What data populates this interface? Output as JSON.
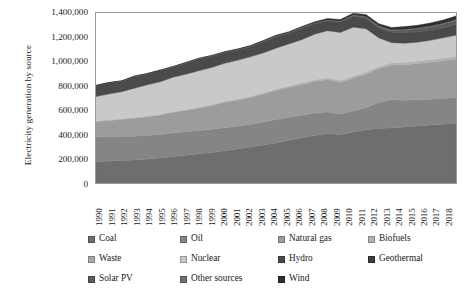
{
  "chart_data": {
    "type": "area",
    "title": "",
    "xlabel": "",
    "ylabel": "Electricity generation by source",
    "stacked": true,
    "grid": false,
    "legend_position": "bottom",
    "ylim": [
      0,
      1400000
    ],
    "ytick_labels": [
      "1,400,000",
      "1,200,000",
      "1,000,000",
      "800,000",
      "600,000",
      "400,000",
      "200,000",
      "0"
    ],
    "ytick_values": [
      1400000,
      1200000,
      1000000,
      800000,
      600000,
      400000,
      200000,
      0
    ],
    "categories": [
      "1990",
      "1991",
      "1992",
      "1993",
      "1994",
      "1995",
      "1996",
      "1997",
      "1998",
      "1999",
      "2000",
      "2001",
      "2002",
      "2003",
      "2004",
      "2005",
      "2006",
      "2007",
      "2008",
      "2009",
      "2010",
      "2011",
      "2012",
      "2013",
      "2014",
      "2015",
      "2016",
      "2017",
      "2018"
    ],
    "series": [
      {
        "name": "Coal",
        "color": "#6e6e6e",
        "values": [
          176000,
          181000,
          186000,
          190000,
          198000,
          206000,
          218000,
          228000,
          240000,
          252000,
          266000,
          280000,
          296000,
          312000,
          330000,
          352000,
          372000,
          392000,
          406000,
          400000,
          420000,
          438000,
          448000,
          456000,
          462000,
          470000,
          478000,
          484000,
          492000
        ]
      },
      {
        "name": "Oil",
        "color": "#858585",
        "values": [
          202000,
          202000,
          198000,
          196000,
          194000,
          194000,
          196000,
          194000,
          192000,
          190000,
          190000,
          188000,
          186000,
          190000,
          192000,
          190000,
          186000,
          184000,
          178000,
          168000,
          172000,
          184000,
          214000,
          230000,
          220000,
          216000,
          212000,
          212000,
          214000
        ]
      },
      {
        "name": "Natural gas",
        "color": "#9c9c9c",
        "values": [
          128000,
          132000,
          140000,
          148000,
          154000,
          160000,
          168000,
          176000,
          186000,
          196000,
          208000,
          214000,
          222000,
          230000,
          240000,
          246000,
          254000,
          262000,
          268000,
          262000,
          272000,
          276000,
          280000,
          286000,
          292000,
          298000,
          304000,
          310000,
          316000
        ]
      },
      {
        "name": "Biofuels",
        "color": "#b2b2b2",
        "values": [
          2000,
          2200,
          2400,
          2600,
          2800,
          3000,
          3300,
          3600,
          3900,
          4200,
          4600,
          5000,
          5400,
          5800,
          6300,
          6800,
          7400,
          8000,
          8600,
          9000,
          9600,
          10200,
          10800,
          11400,
          12000,
          12600,
          13200,
          13800,
          14400
        ]
      },
      {
        "name": "Waste",
        "color": "#a8a8a8",
        "values": [
          1500,
          1600,
          1700,
          1800,
          1900,
          2000,
          2200,
          2400,
          2600,
          2800,
          3000,
          3200,
          3400,
          3600,
          3900,
          4200,
          4500,
          4800,
          5100,
          5300,
          5600,
          5900,
          6200,
          6500,
          6800,
          7100,
          7400,
          7700,
          8000
        ]
      },
      {
        "name": "Nuclear",
        "color": "#c9c9c9",
        "values": [
          202000,
          214000,
          224000,
          242000,
          258000,
          268000,
          284000,
          292000,
          300000,
          306000,
          314000,
          320000,
          326000,
          330000,
          338000,
          346000,
          356000,
          374000,
          388000,
          396000,
          404000,
          356000,
          236000,
          166000,
          158000,
          156000,
          160000,
          168000,
          172000
        ]
      },
      {
        "name": "Hydro",
        "color": "#4a4a4a",
        "values": [
          88000,
          90000,
          84000,
          95000,
          88000,
          91000,
          82000,
          90000,
          96000,
          92000,
          87000,
          84000,
          82000,
          90000,
          94000,
          86000,
          92000,
          84000,
          80000,
          82000,
          88000,
          84000,
          78000,
          80000,
          86000,
          82000,
          80000,
          78000,
          84000
        ]
      },
      {
        "name": "Geothermal",
        "color": "#3d3d3d",
        "values": [
          1500,
          1600,
          1700,
          1800,
          1900,
          2000,
          2100,
          2200,
          2300,
          2400,
          2500,
          2600,
          2700,
          2700,
          2800,
          2800,
          2900,
          2900,
          2900,
          2900,
          2900,
          2900,
          2600,
          2600,
          2600,
          2600,
          2600,
          2600,
          2600
        ]
      },
      {
        "name": "Solar PV",
        "color": "#5c5c5c",
        "values": [
          0,
          0,
          0,
          0,
          0,
          0,
          100,
          200,
          300,
          400,
          500,
          700,
          900,
          1200,
          1600,
          2000,
          2500,
          3000,
          3800,
          5000,
          6800,
          10000,
          14000,
          18000,
          22000,
          26000,
          30000,
          34000,
          38000
        ]
      },
      {
        "name": "Other sources",
        "color": "#707070",
        "values": [
          3000,
          3100,
          3200,
          3300,
          3400,
          3500,
          3600,
          3700,
          3800,
          3900,
          4000,
          4100,
          4200,
          4300,
          4400,
          4500,
          4600,
          4700,
          4800,
          4900,
          5000,
          5100,
          5200,
          5300,
          5400,
          5500,
          5600,
          5700,
          5800
        ]
      },
      {
        "name": "Wind",
        "color": "#2e2e2e",
        "values": [
          0,
          100,
          200,
          300,
          400,
          500,
          600,
          800,
          1000,
          1300,
          1700,
          2200,
          2800,
          3600,
          4500,
          5500,
          6600,
          8000,
          9600,
          11000,
          13000,
          15000,
          17000,
          19000,
          21000,
          23000,
          25000,
          27000,
          29000
        ]
      }
    ]
  },
  "legend": {
    "rows": [
      [
        {
          "label": "Coal",
          "color": "#6e6e6e"
        },
        {
          "label": "Oil",
          "color": "#858585"
        },
        {
          "label": "Natural gas",
          "color": "#9c9c9c"
        },
        {
          "label": "Biofuels",
          "color": "#b2b2b2"
        }
      ],
      [
        {
          "label": "Waste",
          "color": "#a8a8a8"
        },
        {
          "label": "Nuclear",
          "color": "#c9c9c9"
        },
        {
          "label": "Hydro",
          "color": "#4a4a4a"
        },
        {
          "label": "Geothermal",
          "color": "#3d3d3d"
        }
      ],
      [
        {
          "label": "Solar PV",
          "color": "#5c5c5c"
        },
        {
          "label": "Other sources",
          "color": "#707070"
        },
        {
          "label": "Wind",
          "color": "#2e2e2e"
        }
      ]
    ]
  },
  "colors": {
    "axis_line": "#9a9a9a",
    "plot_background": "#ffffff",
    "text": "#1a1a1a"
  }
}
